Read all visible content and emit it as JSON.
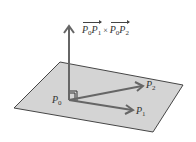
{
  "diagram": {
    "cross_product_label": {
      "vec1": {
        "start": "P",
        "start_sub": "0",
        "end": "P",
        "end_sub": "1"
      },
      "operator": "×",
      "vec2": {
        "start": "P",
        "start_sub": "0",
        "end": "P",
        "end_sub": "2"
      }
    },
    "points": {
      "p0": {
        "name": "P",
        "sub": "0"
      },
      "p1": {
        "name": "P",
        "sub": "1"
      },
      "p2": {
        "name": "P",
        "sub": "2"
      }
    },
    "colors": {
      "plane_fill": "#d4d4d4",
      "plane_stroke": "#333333",
      "arrow": "#666666",
      "label": "#333333"
    }
  }
}
